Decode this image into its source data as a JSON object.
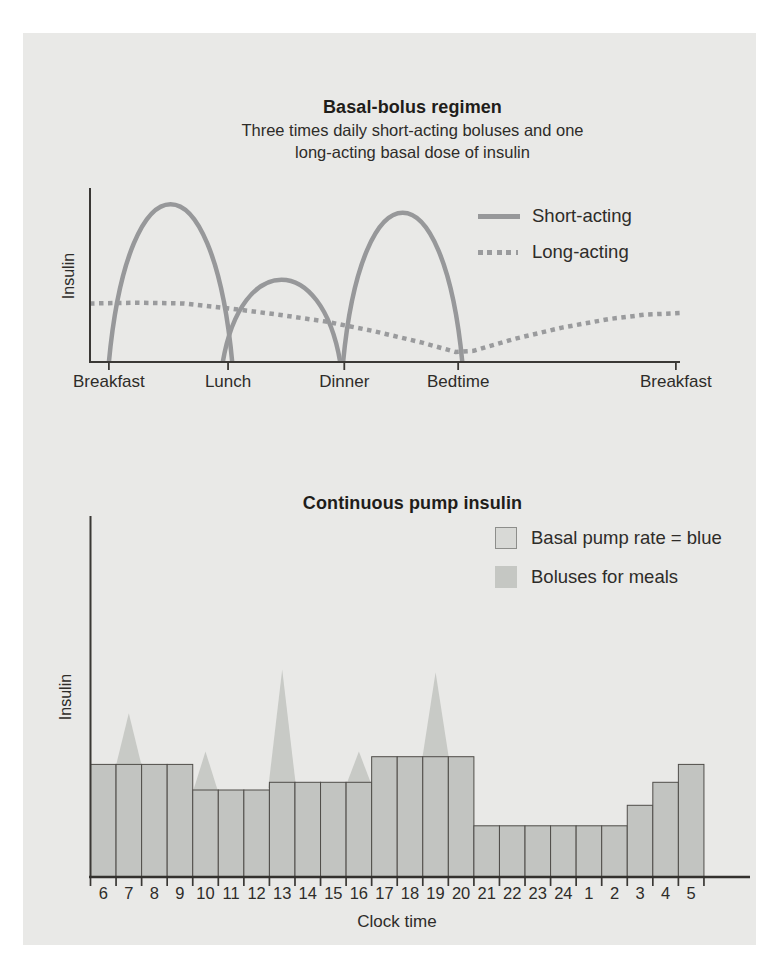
{
  "figure": {
    "panel_background": "#e9e9e7",
    "page_background": "#ffffff"
  },
  "colors": {
    "text": "#2e2c29",
    "title_text": "#1f1d1a",
    "axis": "#3a3835",
    "curve_gray": "#97989a",
    "bar_fill": "#c2c4c1",
    "bar_border": "#4f4d49",
    "bolus_fill": "#c8cac6",
    "legend_basal_fill": "#d8d9d6",
    "legend_basal_border": "#8d8e8b",
    "legend_bolus_fill": "#c5c7c3"
  },
  "chart_data": [
    {
      "type": "line",
      "title": "Basal-bolus regimen",
      "subtitle": [
        "Three times daily short-acting boluses and one",
        "long-acting basal dose of insulin"
      ],
      "ylabel": "Insulin",
      "y_axis": "unlabeled relative insulin level, no gridlines",
      "x_tick_labels": [
        "Breakfast",
        "Lunch",
        "Dinner",
        "Bedtime",
        "Breakfast"
      ],
      "x_tick_pos": [
        0.032,
        0.234,
        0.431,
        0.624,
        0.993
      ],
      "legend": [
        {
          "label": "Short-acting",
          "style": "solid"
        },
        {
          "label": "Long-acting",
          "style": "dotted"
        }
      ],
      "legend_position": "upper right",
      "series": [
        {
          "name": "Short-acting",
          "style": "solid",
          "arcs": [
            {
              "x0": 0.032,
              "xpeak": 0.147,
              "x1": 0.241,
              "height": 0.92
            },
            {
              "x0": 0.225,
              "xpeak": 0.325,
              "x1": 0.424,
              "height": 0.48
            },
            {
              "x0": 0.429,
              "xpeak": 0.52,
              "x1": 0.631,
              "height": 0.87
            }
          ]
        },
        {
          "name": "Long-acting",
          "style": "dotted",
          "points": [
            [
              0.0,
              0.34
            ],
            [
              0.08,
              0.345
            ],
            [
              0.16,
              0.34
            ],
            [
              0.24,
              0.31
            ],
            [
              0.32,
              0.275
            ],
            [
              0.4,
              0.235
            ],
            [
              0.48,
              0.18
            ],
            [
              0.56,
              0.115
            ],
            [
              0.62,
              0.058
            ],
            [
              0.65,
              0.065
            ],
            [
              0.72,
              0.135
            ],
            [
              0.8,
              0.2
            ],
            [
              0.88,
              0.25
            ],
            [
              0.94,
              0.275
            ],
            [
              1.0,
              0.285
            ]
          ]
        }
      ]
    },
    {
      "type": "bar",
      "title": "Continuous pump insulin",
      "xlabel": "Clock time",
      "ylabel": "Insulin",
      "y_axis": "unlabeled relative insulin level, no gridlines",
      "categories": [
        "6",
        "7",
        "8",
        "9",
        "10",
        "11",
        "12",
        "13",
        "14",
        "15",
        "16",
        "17",
        "18",
        "19",
        "20",
        "21",
        "22",
        "23",
        "24",
        "1",
        "2",
        "3",
        "4",
        "5"
      ],
      "basal_rate_units": [
        4.4,
        4.4,
        4.4,
        4.4,
        3.4,
        3.4,
        3.4,
        3.7,
        3.7,
        3.7,
        3.7,
        4.7,
        4.7,
        4.7,
        4.7,
        2.0,
        2.0,
        2.0,
        2.0,
        2.0,
        2.0,
        2.8,
        3.7,
        4.4
      ],
      "boluses": [
        {
          "hour": "7",
          "peak_units": 6.4
        },
        {
          "hour": "10",
          "peak_units": 4.9
        },
        {
          "hour": "13",
          "peak_units": 8.1
        },
        {
          "hour": "16",
          "peak_units": 4.9
        },
        {
          "hour": "19",
          "peak_units": 8.0
        }
      ],
      "legend": [
        {
          "label": "Basal pump rate = blue",
          "swatch": "outlined"
        },
        {
          "label": "Boluses for meals",
          "swatch": "solid"
        }
      ],
      "legend_position": "upper right"
    }
  ]
}
